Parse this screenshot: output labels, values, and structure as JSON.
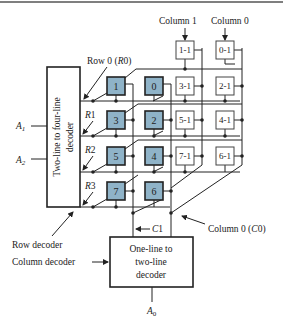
{
  "colors": {
    "shaded_cell": "#8fb3c8",
    "shaded_border": "#222222",
    "line": "#222222",
    "background": "#ffffff"
  },
  "diagram": {
    "column_labels": {
      "col1": "Column 1",
      "col0": "Column 0"
    },
    "row_labels": {
      "r0": "Row 0 (R0)",
      "r1": "R1",
      "r2": "R2",
      "r3": "R3"
    },
    "row_decoder": {
      "text": "Two-line to four-line decoder",
      "line1": "Two-line to four-line",
      "line2": "decoder",
      "caption": "Row decoder"
    },
    "inputs": {
      "a1": "A1",
      "a2": "A2",
      "a0": "A0"
    },
    "column_decoder": {
      "line1": "One-line to",
      "line2": "two-line",
      "line3": "decoder",
      "caption": "Column decoder"
    },
    "c1_label": "C1",
    "c0_label": "Column 0 (C0)",
    "shaded_cells": [
      {
        "label": "1",
        "row": 0,
        "col": "1"
      },
      {
        "label": "0",
        "row": 0,
        "col": "0"
      },
      {
        "label": "3",
        "row": 1,
        "col": "1"
      },
      {
        "label": "2",
        "row": 1,
        "col": "0"
      },
      {
        "label": "5",
        "row": 2,
        "col": "1"
      },
      {
        "label": "4",
        "row": 2,
        "col": "0"
      },
      {
        "label": "7",
        "row": 3,
        "col": "1"
      },
      {
        "label": "6",
        "row": 3,
        "col": "0"
      }
    ],
    "plain_cells": [
      {
        "label": "1-1"
      },
      {
        "label": "0-1"
      },
      {
        "label": "3-1"
      },
      {
        "label": "2-1"
      },
      {
        "label": "5-1"
      },
      {
        "label": "4-1"
      },
      {
        "label": "7-1"
      },
      {
        "label": "6-1"
      }
    ]
  }
}
